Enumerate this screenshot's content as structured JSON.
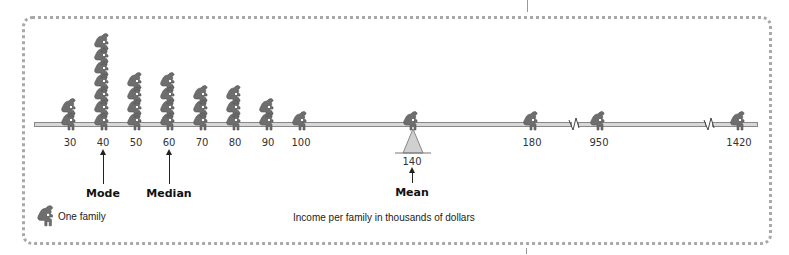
{
  "chart_data": {
    "type": "pictograph",
    "title": "",
    "xlabel": "Income per family in thousands of dollars",
    "legend": "One family",
    "categories": [
      "30",
      "40",
      "50",
      "60",
      "70",
      "80",
      "90",
      "100",
      "140",
      "180",
      "950",
      "1420"
    ],
    "values": [
      2,
      7,
      4,
      4,
      3,
      3,
      2,
      1,
      1,
      1,
      1,
      1
    ],
    "annotations": [
      {
        "label": "Mode",
        "x": "40"
      },
      {
        "label": "Median",
        "x": "60"
      },
      {
        "label": "Mean",
        "x": "140",
        "note": "fulcrum / balance point"
      }
    ],
    "axis_breaks": [
      "between 180 and 950",
      "between 950 and 1420"
    ]
  },
  "labels": {
    "mode": "Mode",
    "median": "Median",
    "mean": "Mean",
    "legend": "One family",
    "xlabel": "Income per family in thousands of dollars"
  },
  "ticks": [
    "30",
    "40",
    "50",
    "60",
    "70",
    "80",
    "90",
    "100",
    "140",
    "180",
    "950",
    "1420"
  ]
}
